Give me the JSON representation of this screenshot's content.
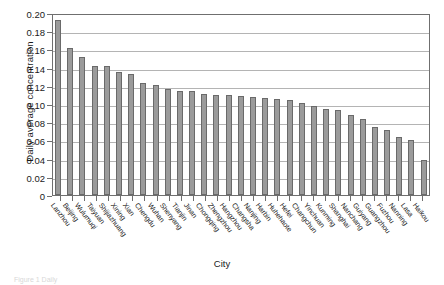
{
  "chart_data": {
    "type": "bar",
    "title": "",
    "xlabel": "City",
    "ylabel": "Daily average concentration",
    "ylim": [
      0,
      0.2
    ],
    "ytick_labels": [
      "0.20",
      "0.18",
      "0.16",
      "0.14",
      "0.12",
      "0.10",
      "0.08",
      "0.06",
      "0.04",
      "0.02",
      "0"
    ],
    "ytick_values": [
      0.2,
      0.18,
      0.16,
      0.14,
      0.12,
      0.1,
      0.08,
      0.06,
      0.04,
      0.02,
      0
    ],
    "grid": true,
    "legend": "none",
    "bar_fill_color": "#9b9b9b",
    "bar_edge_color": "#6a6a6a",
    "axis_color": "#6f6f6f",
    "gridline_color": "#b4b4b4",
    "categories": [
      "Lanzhou",
      "Beijing",
      "Wulumuqi",
      "Taiyuan",
      "Shijiazhuang",
      "Xining",
      "Xian",
      "Chengdu",
      "Wuhan",
      "Shenyang",
      "Tianjin",
      "Jinan",
      "Chongqing",
      "Zhengzhou",
      "Hangzhou",
      "Changsha",
      "Nanjing",
      "Harbin",
      "Huhehaote",
      "Hefei",
      "Changchun",
      "Yinchuan",
      "Kunming",
      "Shanghai",
      "Nanchang",
      "Guiyang",
      "Guangzhou",
      "Fuzhou",
      "Nanning",
      "Lasa",
      "Haikou"
    ],
    "values": [
      0.192,
      0.162,
      0.152,
      0.142,
      0.142,
      0.135,
      0.133,
      0.123,
      0.121,
      0.117,
      0.114,
      0.114,
      0.111,
      0.11,
      0.11,
      0.109,
      0.108,
      0.107,
      0.105,
      0.104,
      0.101,
      0.098,
      0.095,
      0.093,
      0.088,
      0.084,
      0.075,
      0.071,
      0.064,
      0.06,
      0.039
    ]
  },
  "caption": {
    "ghost_text": "Figure 1  Daily"
  }
}
